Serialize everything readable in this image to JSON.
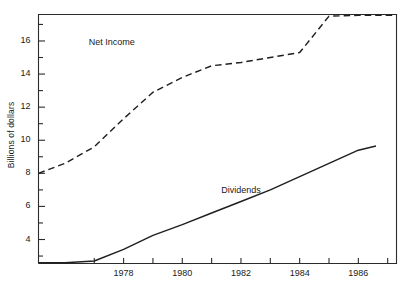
{
  "chart_data": {
    "type": "line",
    "title": "",
    "subtitle": "",
    "xlabel": "",
    "ylabel": "Billions of dollars",
    "xlim": [
      1975.1,
      1987.3
    ],
    "ylim": [
      2.55,
      17.6
    ],
    "grid": false,
    "legend_position": "inline-annotations",
    "x_ticks_major": [
      1977,
      1978,
      1979,
      1980,
      1981,
      1982,
      1983,
      1984,
      1985,
      1986,
      1987
    ],
    "x_tick_labels": [
      "1978",
      "1980",
      "1982",
      "1984",
      "1986"
    ],
    "x_tick_label_values": [
      1978,
      1980,
      1982,
      1984,
      1986
    ],
    "y_ticks_major": [
      4,
      6,
      8,
      10,
      12,
      14,
      16
    ],
    "y_tick_labels": [
      "4",
      "6",
      "8",
      "10",
      "12",
      "14",
      "16"
    ],
    "y_ticks_minor": [
      3,
      5,
      7,
      9,
      11,
      13,
      15,
      17
    ],
    "series": [
      {
        "name": "Net Income",
        "style": "dashed",
        "label": "Net Income",
        "x": [
          1975.1,
          1976.0,
          1977.0,
          1978.0,
          1979.0,
          1980.0,
          1981.0,
          1982.0,
          1983.0,
          1984.0,
          1985.0,
          1986.0,
          1987.3
        ],
        "values": [
          8.0,
          8.6,
          9.6,
          11.3,
          12.9,
          13.8,
          14.5,
          14.7,
          15.0,
          15.3,
          17.5,
          17.55,
          17.55
        ]
      },
      {
        "name": "Dividends",
        "style": "solid",
        "label": "Dividends",
        "x": [
          1975.1,
          1976.0,
          1977.0,
          1978.0,
          1979.0,
          1980.0,
          1981.0,
          1982.0,
          1983.0,
          1984.0,
          1985.0,
          1986.0,
          1986.6
        ],
        "values": [
          2.6,
          2.6,
          2.7,
          3.4,
          4.25,
          4.9,
          5.6,
          6.3,
          7.0,
          7.8,
          8.6,
          9.4,
          9.65
        ]
      }
    ],
    "annotations": [
      {
        "text": "Net Income",
        "x": 1977.6,
        "y": 15.9
      },
      {
        "text": "Dividends",
        "x": 1982.0,
        "y": 6.95
      }
    ],
    "colors": {
      "axis": "#2b2b2b",
      "net_income_line": "#1f1f1f",
      "dividends_line": "#1f1f1f",
      "background": "#ffffff"
    }
  }
}
